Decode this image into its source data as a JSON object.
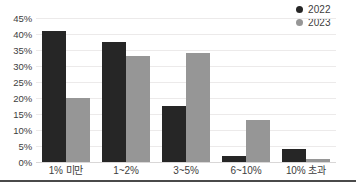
{
  "chart_data": {
    "type": "bar",
    "title": "",
    "subtitle": "",
    "xlabel": "",
    "ylabel": "",
    "categories": [
      "1% 미만",
      "1~2%",
      "3~5%",
      "6~10%",
      "10% 초과"
    ],
    "series": [
      {
        "name": "2022",
        "color": "#262626",
        "values": [
          41,
          37.5,
          17.5,
          2,
          4
        ]
      },
      {
        "name": "2023",
        "color": "#969696",
        "values": [
          20,
          33,
          34,
          13,
          1
        ]
      }
    ],
    "ylim": [
      0,
      45
    ],
    "ytick_step": 5,
    "ytick_labels": [
      "45%",
      "40%",
      "35%",
      "30%",
      "25%",
      "20%",
      "15%",
      "10%",
      "5%",
      "0%"
    ],
    "ytick_values": [
      45,
      40,
      35,
      30,
      25,
      20,
      15,
      10,
      5,
      0
    ],
    "grid": true,
    "grid_color": "#eceaea",
    "legend_position": "top-right",
    "orientation": "vertical",
    "background": "#ffffff",
    "axis_text_color": "#3d3d3d"
  }
}
